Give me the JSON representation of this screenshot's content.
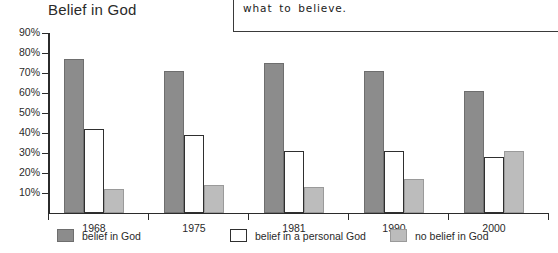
{
  "chart_data": {
    "type": "bar",
    "title": "Belief in God",
    "xlabel": "",
    "ylabel": "",
    "categories": [
      "1968",
      "1975",
      "1981",
      "1990",
      "2000"
    ],
    "series": [
      {
        "name": "belief in God",
        "values": [
          77,
          71,
          75,
          71,
          61
        ],
        "color": "#8c8c8c"
      },
      {
        "name": "belief in a personal God",
        "values": [
          42,
          39,
          31,
          31,
          28
        ],
        "color": "#ffffff"
      },
      {
        "name": "no belief in God",
        "values": [
          12,
          14,
          13,
          17,
          31
        ],
        "color": "#bcbcbc"
      }
    ],
    "ylim": [
      0,
      90
    ],
    "yticks": [
      10,
      20,
      30,
      40,
      50,
      60,
      70,
      80,
      90
    ],
    "ytick_labels": [
      "10%",
      "20%",
      "30%",
      "40%",
      "50%",
      "60%",
      "70%",
      "80%",
      "90%"
    ],
    "grid": false,
    "legend_position": "bottom"
  },
  "note": {
    "lines": [
      "sure about religion and does not know",
      "what to believe."
    ]
  }
}
